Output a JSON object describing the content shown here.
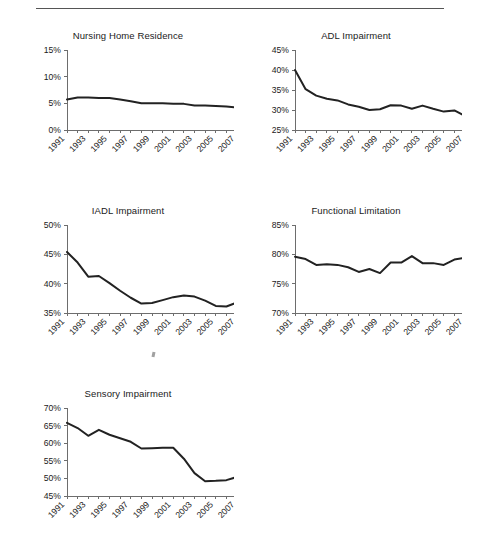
{
  "figure": {
    "rule_present": true,
    "background_color": "#ffffff",
    "line_color": "#222222",
    "axis_color": "#6d6d6d"
  },
  "charts": [
    {
      "id": "nursing-home-residence",
      "title": "Nursing Home Residence",
      "position": {
        "left": 22,
        "top": 30,
        "width": 212,
        "height": 150
      },
      "plot": {
        "left": 45,
        "top": 6,
        "width": 170,
        "height": 80
      },
      "chart_data": {
        "type": "line",
        "title": "Nursing Home Residence",
        "xlabel": "",
        "ylabel": "",
        "grid": false,
        "legend": "none",
        "ylim": [
          0,
          15
        ],
        "ytick_values": [
          0,
          5,
          10,
          15
        ],
        "ytick_labels": [
          "0%",
          "5%",
          "10%",
          "15%"
        ],
        "x": [
          1991,
          1992,
          1993,
          1994,
          1995,
          1996,
          1997,
          1998,
          1999,
          2000,
          2001,
          2002,
          2003,
          2004,
          2005,
          2006,
          2007
        ],
        "xtick_labels": [
          "1991",
          "1993",
          "1995",
          "1997",
          "1999",
          "2001",
          "2003",
          "2005",
          "2007"
        ],
        "values": [
          5.7,
          6.1,
          6.1,
          6.0,
          6.0,
          5.7,
          5.4,
          5.0,
          5.0,
          5.0,
          4.9,
          4.9,
          4.6,
          4.6,
          4.5,
          4.4,
          4.2
        ]
      }
    },
    {
      "id": "adl-impairment",
      "title": "ADL Impairment",
      "position": {
        "left": 250,
        "top": 30,
        "width": 212,
        "height": 150
      },
      "plot": {
        "left": 45,
        "top": 6,
        "width": 170,
        "height": 80
      },
      "chart_data": {
        "type": "line",
        "title": "ADL Impairment",
        "xlabel": "",
        "ylabel": "",
        "grid": false,
        "legend": "none",
        "ylim": [
          25,
          45
        ],
        "ytick_values": [
          25,
          30,
          35,
          40,
          45
        ],
        "ytick_labels": [
          "25%",
          "30%",
          "35%",
          "40%",
          "45%"
        ],
        "x": [
          1991,
          1992,
          1993,
          1994,
          1995,
          1996,
          1997,
          1998,
          1999,
          2000,
          2001,
          2002,
          2003,
          2004,
          2005,
          2006,
          2007
        ],
        "xtick_labels": [
          "1991",
          "1993",
          "1995",
          "1997",
          "1999",
          "2001",
          "2003",
          "2005",
          "2007"
        ],
        "values": [
          40.0,
          35.2,
          33.6,
          32.8,
          32.4,
          31.4,
          30.8,
          30.0,
          30.2,
          31.2,
          31.1,
          30.3,
          31.1,
          30.3,
          29.6,
          29.9,
          28.5
        ]
      }
    },
    {
      "id": "iadl-impairment",
      "title": "IADL Impairment",
      "position": {
        "left": 22,
        "top": 205,
        "width": 212,
        "height": 155
      },
      "plot": {
        "left": 45,
        "top": 6,
        "width": 170,
        "height": 88
      },
      "chart_data": {
        "type": "line",
        "title": "IADL Impairment",
        "xlabel": "",
        "ylabel": "",
        "grid": false,
        "legend": "none",
        "ylim": [
          35,
          50
        ],
        "ytick_values": [
          35,
          40,
          45,
          50
        ],
        "ytick_labels": [
          "35%",
          "40%",
          "45%",
          "50%"
        ],
        "x": [
          1991,
          1992,
          1993,
          1994,
          1995,
          1996,
          1997,
          1998,
          1999,
          2000,
          2001,
          2002,
          2003,
          2004,
          2005,
          2006,
          2007
        ],
        "xtick_labels": [
          "1991",
          "1993",
          "1995",
          "1997",
          "1999",
          "2001",
          "2003",
          "2005",
          "2007"
        ],
        "values": [
          45.4,
          43.6,
          41.2,
          41.3,
          40.1,
          38.8,
          37.6,
          36.6,
          36.7,
          37.2,
          37.7,
          38.0,
          37.8,
          37.1,
          36.2,
          36.1,
          36.8
        ]
      }
    },
    {
      "id": "functional-limitation",
      "title": "Functional Limitation",
      "position": {
        "left": 250,
        "top": 205,
        "width": 212,
        "height": 155
      },
      "plot": {
        "left": 45,
        "top": 6,
        "width": 170,
        "height": 88
      },
      "chart_data": {
        "type": "line",
        "title": "Functional Limitation",
        "xlabel": "",
        "ylabel": "",
        "grid": false,
        "legend": "none",
        "ylim": [
          70,
          85
        ],
        "ytick_values": [
          70,
          75,
          80,
          85
        ],
        "ytick_labels": [
          "70%",
          "75%",
          "80%",
          "85%"
        ],
        "x": [
          1991,
          1992,
          1993,
          1994,
          1995,
          1996,
          1997,
          1998,
          1999,
          2000,
          2001,
          2002,
          2003,
          2004,
          2005,
          2006,
          2007
        ],
        "xtick_labels": [
          "1991",
          "1993",
          "1995",
          "1997",
          "1999",
          "2001",
          "2003",
          "2005",
          "2007"
        ],
        "values": [
          79.6,
          79.2,
          78.2,
          78.3,
          78.2,
          77.8,
          77.0,
          77.5,
          76.8,
          78.6,
          78.6,
          79.7,
          78.5,
          78.5,
          78.2,
          79.1,
          79.4
        ]
      }
    },
    {
      "id": "sensory-impairment",
      "title": "Sensory Impairment",
      "position": {
        "left": 22,
        "top": 388,
        "width": 212,
        "height": 152
      },
      "plot": {
        "left": 45,
        "top": 6,
        "width": 170,
        "height": 88
      },
      "chart_data": {
        "type": "line",
        "title": "Sensory Impairment",
        "xlabel": "",
        "ylabel": "",
        "grid": false,
        "legend": "none",
        "ylim": [
          45,
          70
        ],
        "ytick_values": [
          45,
          50,
          55,
          60,
          65,
          70
        ],
        "ytick_labels": [
          "45%",
          "50%",
          "55%",
          "60%",
          "65%",
          "70%"
        ],
        "x": [
          1991,
          1992,
          1993,
          1994,
          1995,
          1996,
          1997,
          1998,
          1999,
          2000,
          2001,
          2002,
          2003,
          2004,
          2005,
          2006,
          2007
        ],
        "xtick_labels": [
          "1991",
          "1993",
          "1995",
          "1997",
          "1999",
          "2001",
          "2003",
          "2005",
          "2007"
        ],
        "values": [
          65.8,
          64.3,
          62.1,
          63.8,
          62.4,
          61.4,
          60.4,
          58.5,
          58.6,
          58.7,
          58.7,
          55.6,
          51.5,
          49.2,
          49.3,
          49.5,
          50.4
        ]
      }
    }
  ]
}
